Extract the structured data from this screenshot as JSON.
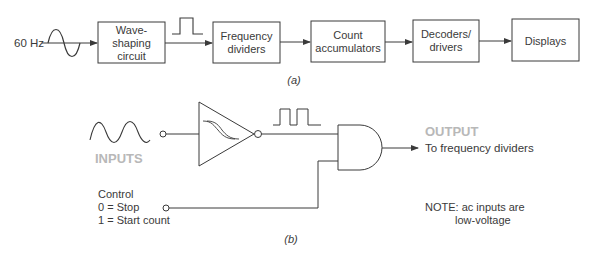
{
  "diagram": {
    "part_a": {
      "caption": "(a)",
      "input_label": "60 Hz",
      "blocks": [
        {
          "line1": "Wave-",
          "line2": "shaping",
          "line3": "circuit"
        },
        {
          "line1": "Frequency",
          "line2": "dividers"
        },
        {
          "line1": "Count",
          "line2": "accumulators"
        },
        {
          "line1": "Decoders/",
          "line2": "drivers"
        },
        {
          "line1": "Displays"
        }
      ]
    },
    "part_b": {
      "caption": "(b)",
      "inputs_label": "INPUTS",
      "output_label": "OUTPUT",
      "output_destination": "To frequency dividers",
      "control": {
        "title": "Control",
        "stop": "0 = Stop",
        "start": "1 = Start count"
      },
      "note": {
        "line1": "NOTE: ac inputs are",
        "line2": "low-voltage"
      }
    },
    "colors": {
      "line": "#3a3a3a",
      "text": "#3a3a3a",
      "highlight_gray": "#b8b8b8",
      "background": "#ffffff"
    }
  }
}
